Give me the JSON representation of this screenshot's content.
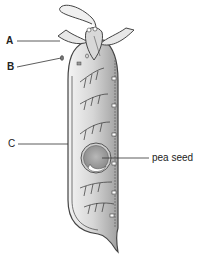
{
  "diagram": {
    "labels": [
      {
        "id": "A",
        "text": "A",
        "x": 6,
        "y": 36
      },
      {
        "id": "B",
        "text": "B",
        "x": 7,
        "y": 62
      },
      {
        "id": "C",
        "text": "C",
        "x": 8,
        "y": 139
      },
      {
        "id": "pea_seed",
        "text": "pea seed",
        "x": 152,
        "y": 153
      }
    ],
    "colors": {
      "outline": "#444444",
      "pod_fill_light": "#f2f2f2",
      "pod_fill_dark": "#a8a8a8",
      "leader_line": "#333333"
    }
  }
}
